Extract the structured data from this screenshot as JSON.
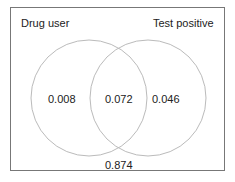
{
  "diagram": {
    "type": "venn",
    "sets": [
      {
        "label": "Drug user",
        "only_value": "0.008"
      },
      {
        "label": "Test positive",
        "only_value": "0.046"
      }
    ],
    "intersection_value": "0.072",
    "outside_value": "0.874",
    "circle_color": "#bbbbbb",
    "border_color": "#777777"
  }
}
